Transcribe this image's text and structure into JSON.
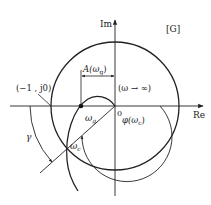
{
  "diagram": {
    "type": "nyquist-plot",
    "title_label": "[G]",
    "axes": {
      "real": "Re",
      "imag": "Im",
      "origin": "0"
    },
    "labels": {
      "critical_point": "(−1 , j0)",
      "gain_magnitude": "A(ω",
      "gain_magnitude_sub": "g",
      "gain_magnitude_close": ")",
      "omega_inf": "(ω → ∞)",
      "omega_g": "ω",
      "omega_g_sub": "g",
      "omega_c": "ω",
      "omega_c_sub": "c",
      "phase": "φ(ω",
      "phase_sub": "c",
      "phase_close": ")",
      "phase_margin": "γ"
    },
    "elements": [
      "unit-circle",
      "nyquist-curve",
      "phase-crossover-point",
      "gain-crossover-point",
      "phase-margin-arc",
      "phase-angle-arc",
      "magnitude-dimension"
    ],
    "colors": {
      "stroke": "#222222",
      "background": "#ffffff"
    }
  }
}
